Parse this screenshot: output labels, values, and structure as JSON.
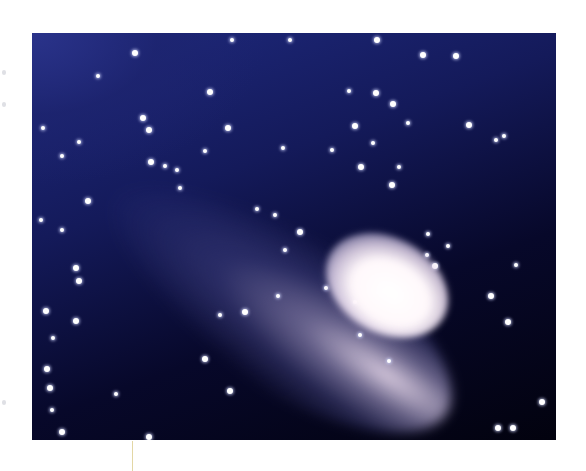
{
  "figure": {
    "alt": "Comet photograph",
    "colors": {
      "sky_dark": "#02020e",
      "sky_blue": "#1f2a80",
      "coma": "#ffffff",
      "tail": "#b4aadc",
      "leader_line": "#e3d7a5"
    },
    "bounds": {
      "left": 32,
      "top": 33,
      "width": 524,
      "height": 407
    }
  },
  "stars": [
    [
      135,
      53,
      3
    ],
    [
      232,
      40,
      2
    ],
    [
      290,
      40,
      2
    ],
    [
      377,
      40,
      3
    ],
    [
      423,
      55,
      3
    ],
    [
      456,
      56,
      3
    ],
    [
      98,
      76,
      2
    ],
    [
      210,
      92,
      3
    ],
    [
      349,
      91,
      2
    ],
    [
      376,
      93,
      3
    ],
    [
      393,
      104,
      3
    ],
    [
      149,
      130,
      3
    ],
    [
      228,
      128,
      3
    ],
    [
      355,
      126,
      3
    ],
    [
      373,
      143,
      2
    ],
    [
      43,
      128,
      2
    ],
    [
      143,
      118,
      3
    ],
    [
      79,
      142,
      2
    ],
    [
      62,
      156,
      2
    ],
    [
      151,
      162,
      3
    ],
    [
      177,
      170,
      2
    ],
    [
      205,
      151,
      2
    ],
    [
      283,
      148,
      2
    ],
    [
      361,
      167,
      3
    ],
    [
      399,
      167,
      2
    ],
    [
      392,
      185,
      3
    ],
    [
      332,
      150,
      2
    ],
    [
      408,
      123,
      2
    ],
    [
      469,
      125,
      3
    ],
    [
      504,
      136,
      2
    ],
    [
      496,
      140,
      2
    ],
    [
      428,
      234,
      2
    ],
    [
      427,
      255,
      2
    ],
    [
      435,
      266,
      3
    ],
    [
      448,
      246,
      2
    ],
    [
      491,
      296,
      3
    ],
    [
      508,
      322,
      3
    ],
    [
      516,
      265,
      2
    ],
    [
      300,
      232,
      3
    ],
    [
      285,
      250,
      2
    ],
    [
      76,
      268,
      3
    ],
    [
      79,
      281,
      3
    ],
    [
      46,
      311,
      3
    ],
    [
      76,
      321,
      3
    ],
    [
      53,
      338,
      2
    ],
    [
      205,
      359,
      3
    ],
    [
      220,
      315,
      2
    ],
    [
      245,
      312,
      3
    ],
    [
      230,
      391,
      3
    ],
    [
      116,
      394,
      2
    ],
    [
      47,
      369,
      3
    ],
    [
      50,
      388,
      3
    ],
    [
      52,
      410,
      2
    ],
    [
      62,
      432,
      3
    ],
    [
      149,
      437,
      3
    ],
    [
      278,
      296,
      2
    ],
    [
      326,
      288,
      2
    ],
    [
      355,
      302,
      2
    ],
    [
      360,
      335,
      2
    ],
    [
      389,
      361,
      2
    ],
    [
      513,
      428,
      3
    ],
    [
      498,
      428,
      3
    ],
    [
      542,
      402,
      3
    ],
    [
      88,
      201,
      3
    ],
    [
      62,
      230,
      2
    ],
    [
      180,
      188,
      2
    ],
    [
      257,
      209,
      2
    ],
    [
      275,
      215,
      2
    ],
    [
      41,
      220,
      2
    ],
    [
      165,
      166,
      2
    ]
  ],
  "margin_marks": [
    {
      "x": 2,
      "y": 70
    },
    {
      "x": 2,
      "y": 102
    },
    {
      "x": 2,
      "y": 400
    }
  ]
}
